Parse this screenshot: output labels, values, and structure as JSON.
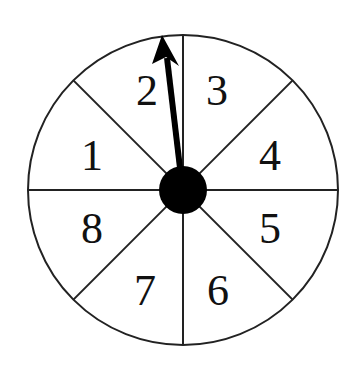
{
  "figure": {
    "type": "spinner",
    "sections": 8,
    "colors": {
      "stroke": "#222222",
      "fill": "#ffffff",
      "hub": "#000000",
      "arrow": "#000000"
    },
    "center": {
      "x": 183,
      "y": 190
    },
    "radius": 155,
    "labels": [
      {
        "text": "1",
        "x": 92,
        "y": 170
      },
      {
        "text": "2",
        "x": 147,
        "y": 105
      },
      {
        "text": "3",
        "x": 217,
        "y": 105
      },
      {
        "text": "4",
        "x": 270,
        "y": 170
      },
      {
        "text": "5",
        "x": 270,
        "y": 243
      },
      {
        "text": "6",
        "x": 218,
        "y": 305
      },
      {
        "text": "7",
        "x": 145,
        "y": 305
      },
      {
        "text": "8",
        "x": 92,
        "y": 243
      }
    ],
    "arrow_pointing_to": "2"
  }
}
